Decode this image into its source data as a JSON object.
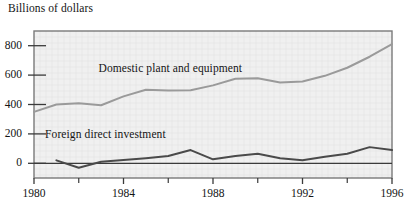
{
  "figure": {
    "axis_title": "Billions of dollars",
    "background_color": "#ffffff",
    "plot_background_color": "#f0f0f0",
    "frame_color": "#7a7a7a",
    "grid_color": "#e2e2e2"
  },
  "chart_data": {
    "type": "line",
    "title": "",
    "subtitle": "",
    "xlabel": "",
    "ylabel": "Billions of dollars",
    "xlim": [
      1980,
      1996
    ],
    "ylim": [
      -100,
      900
    ],
    "grid": true,
    "legend_position": "inline-annotation",
    "x": [
      1980,
      1981,
      1982,
      1983,
      1984,
      1985,
      1986,
      1987,
      1988,
      1989,
      1990,
      1991,
      1992,
      1993,
      1994,
      1995,
      1996
    ],
    "xticks": [
      1980,
      1984,
      1988,
      1992,
      1996
    ],
    "xtick_labels": [
      "1980",
      "1984",
      "1988",
      "1992",
      "1996"
    ],
    "xminorticks": [
      1982,
      1986,
      1990,
      1994
    ],
    "yticks": [
      0,
      200,
      400,
      600,
      800
    ],
    "ytick_labels": [
      "0",
      "200",
      "400",
      "600",
      "800"
    ],
    "series": [
      {
        "name": "Domestic plant and equipment",
        "color": "#9a9a9a",
        "line_width": 2.0,
        "label_x": 1986.1,
        "label_y": 640,
        "values": [
          350,
          400,
          408,
          395,
          455,
          500,
          495,
          497,
          530,
          575,
          578,
          550,
          557,
          595,
          650,
          725,
          810
        ]
      },
      {
        "name": "Foreign direct investment",
        "color": "#4a4a4a",
        "line_width": 2.0,
        "label_x": 1983.2,
        "label_y": 195,
        "values": [
          null,
          20,
          -30,
          10,
          22,
          35,
          50,
          90,
          27,
          50,
          65,
          35,
          20,
          45,
          65,
          110,
          90
        ]
      }
    ],
    "zero_line": 0,
    "zero_line_color": "#3a3a3a",
    "annotations": [
      {
        "text": "Domestic plant and equipment",
        "x": 1986.1,
        "y": 640
      },
      {
        "text": "Foreign direct investment",
        "x": 1983.2,
        "y": 195
      }
    ]
  }
}
